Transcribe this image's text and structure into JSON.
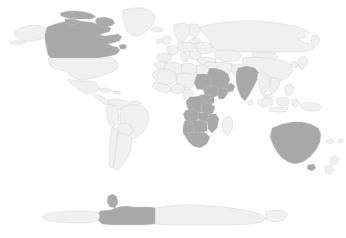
{
  "page": {
    "type": "choropleth-world-map",
    "projection": "equirectangular",
    "background_color": "#ffffff"
  },
  "map": {
    "name": "world-choropleth",
    "width": 346,
    "height": 238,
    "border_color": "#c9c9c9",
    "border_width": 0.35,
    "fill_levels": [
      {
        "key": "base",
        "label": "Not highlighted",
        "color": "#f0f0f0"
      },
      {
        "key": "highlighted",
        "label": "Highlighted",
        "color": "#a9a9a9"
      }
    ],
    "highlighted_regions": [
      "Canada",
      "Saudi Arabia",
      "Yemen",
      "Oman",
      "India",
      "Australia",
      "Sudan",
      "Ethiopia",
      "Kenya",
      "Tanzania",
      "Zambia",
      "Zimbabwe",
      "Mozambique",
      "Botswana",
      "South Africa",
      "Namibia",
      "Angola",
      "Democratic Republic of the Congo",
      "Antarctica (western sector)"
    ],
    "base_regions": [
      "United States",
      "Mexico",
      "Greenland",
      "Brazil",
      "Argentina",
      "Chile",
      "Peru",
      "Colombia",
      "Russia",
      "China",
      "Kazakhstan",
      "Mongolia",
      "Iran",
      "Turkey",
      "Egypt",
      "Libya",
      "Algeria",
      "Morocco",
      "Nigeria",
      "France",
      "Germany",
      "Spain",
      "Poland",
      "Ukraine",
      "Sweden",
      "Norway",
      "Finland",
      "Japan",
      "Indonesia",
      "Papua New Guinea",
      "New Zealand",
      "Madagascar",
      "Antarctica (eastern sector)"
    ]
  },
  "legend": {
    "visible": false,
    "title": "",
    "entries": []
  },
  "labels": {
    "visible": false,
    "items": []
  }
}
